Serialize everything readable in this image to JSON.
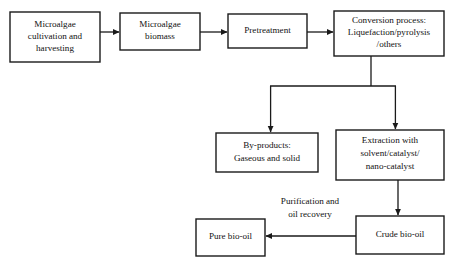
{
  "diagram": {
    "background_color": "#ffffff",
    "line_color": "#1a1a1a",
    "text_color": "#111111",
    "nodes": [
      {
        "id": "microalgae-cultivation",
        "lines": [
          "Microalgae",
          "cultivation and",
          "harvesting"
        ]
      },
      {
        "id": "microalgae-biomass",
        "lines": [
          "Microalgae",
          "biomass"
        ]
      },
      {
        "id": "pretreatment",
        "lines": [
          "Pretreatment"
        ]
      },
      {
        "id": "conversion-process",
        "lines": [
          "Conversion process:",
          "Liquefaction/pyrolysis",
          "/others"
        ]
      },
      {
        "id": "by-products",
        "lines": [
          "By-products:",
          "Gaseous and solid"
        ]
      },
      {
        "id": "extraction",
        "lines": [
          "Extraction with",
          "solvent/catalyst/",
          "nano-catalyst"
        ]
      },
      {
        "id": "pure-bio-oil",
        "lines": [
          "Pure bio-oil"
        ]
      },
      {
        "id": "crude-bio-oil",
        "lines": [
          "Crude bio-oil"
        ]
      }
    ],
    "edge_labels": [
      {
        "id": "purification-label",
        "lines": [
          "Purification and",
          "oil recovery"
        ]
      }
    ]
  }
}
